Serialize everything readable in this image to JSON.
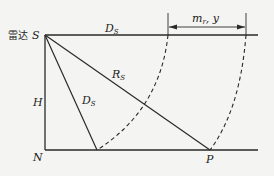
{
  "diagram": {
    "labels": {
      "radar": "雷达",
      "S": "S",
      "D_top": "D",
      "D_top_sub": "S",
      "R": "R",
      "R_sub": "S",
      "D_slant": "D",
      "D_slant_sub": "S",
      "H": "H",
      "N": "N",
      "P": "P",
      "m": "m",
      "m_sub": "r",
      "y": "y"
    },
    "colors": {
      "line": "#2a2a2a",
      "background": "#f4f4f2"
    }
  }
}
